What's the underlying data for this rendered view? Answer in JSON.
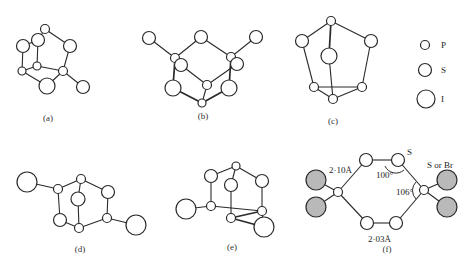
{
  "figure": {
    "legend": {
      "items": [
        {
          "symbol": "P",
          "label": "P",
          "r": 4.5,
          "cx": 425,
          "cy": 45
        },
        {
          "symbol": "S",
          "label": "S",
          "r": 6.5,
          "cx": 425,
          "cy": 70
        },
        {
          "symbol": "I",
          "label": "I",
          "r": 9,
          "cx": 426,
          "cy": 99
        }
      ],
      "label_x": 441
    },
    "panels": [
      {
        "id": "a",
        "caption": "(a)",
        "caption_pos": [
          48,
          121
        ],
        "atoms": [
          {
            "id": "p1",
            "type": "P",
            "cx": 45,
            "cy": 29,
            "r": 4.5
          },
          {
            "id": "s1",
            "type": "S",
            "cx": 38,
            "cy": 40,
            "r": 6.5
          },
          {
            "id": "i1",
            "type": "I",
            "cx": 23,
            "cy": 46,
            "r": 6.5
          },
          {
            "id": "s2",
            "type": "S",
            "cx": 70,
            "cy": 46,
            "r": 6.5
          },
          {
            "id": "p2",
            "type": "P",
            "cx": 37,
            "cy": 66,
            "r": 4
          },
          {
            "id": "p3",
            "type": "P",
            "cx": 22,
            "cy": 71,
            "r": 4
          },
          {
            "id": "p4",
            "type": "P",
            "cx": 63,
            "cy": 71,
            "r": 4.5
          },
          {
            "id": "i2",
            "type": "I",
            "cx": 47,
            "cy": 86,
            "r": 8
          },
          {
            "id": "s3",
            "type": "S",
            "cx": 83,
            "cy": 87,
            "r": 6.5
          }
        ],
        "bonds": [
          [
            "p1",
            "s1"
          ],
          [
            "p1",
            "s2"
          ],
          [
            "s2",
            "p4"
          ],
          [
            "s1",
            "p2"
          ],
          [
            "p2",
            "p4"
          ],
          [
            "i1",
            "p3"
          ],
          [
            "i1",
            "s1"
          ],
          [
            "p3",
            "i2"
          ],
          [
            "i2",
            "p4"
          ],
          [
            "p4",
            "s3"
          ],
          [
            "p3",
            "p2"
          ]
        ]
      },
      {
        "id": "b",
        "caption": "(b)",
        "caption_pos": [
          203,
          119
        ],
        "atoms": [
          {
            "id": "i1",
            "type": "S",
            "cx": 149,
            "cy": 38,
            "r": 6.5
          },
          {
            "id": "s1",
            "type": "S",
            "cx": 201,
            "cy": 37,
            "r": 6.5
          },
          {
            "id": "i2",
            "type": "S",
            "cx": 256,
            "cy": 37,
            "r": 6.5
          },
          {
            "id": "p1",
            "type": "P",
            "cx": 175,
            "cy": 58,
            "r": 4.5
          },
          {
            "id": "s2",
            "type": "S",
            "cx": 181,
            "cy": 65,
            "r": 6.5
          },
          {
            "id": "p2",
            "type": "P",
            "cx": 231,
            "cy": 57,
            "r": 4.5
          },
          {
            "id": "s3",
            "type": "S",
            "cx": 237,
            "cy": 64,
            "r": 6.5
          },
          {
            "id": "p3",
            "type": "P",
            "cx": 207,
            "cy": 85,
            "r": 4.5
          },
          {
            "id": "i3",
            "type": "I",
            "cx": 173,
            "cy": 88,
            "r": 8
          },
          {
            "id": "i4",
            "type": "I",
            "cx": 229,
            "cy": 88,
            "r": 8
          },
          {
            "id": "p4",
            "type": "P",
            "cx": 202,
            "cy": 103,
            "r": 4
          }
        ],
        "bonds": [
          [
            "i1",
            "p1"
          ],
          [
            "p1",
            "s1"
          ],
          [
            "s1",
            "p2"
          ],
          [
            "p2",
            "i2"
          ],
          [
            "p1",
            "i3"
          ],
          [
            "p2",
            "i4"
          ],
          [
            "s2",
            "p3"
          ],
          [
            "p3",
            "s3"
          ],
          [
            "i3",
            "p4"
          ],
          [
            "p4",
            "i4"
          ],
          [
            "p3",
            "p4"
          ]
        ],
        "thick_bonds": [
          [
            "p1",
            "i3"
          ],
          [
            "p2",
            "i4"
          ],
          [
            "i3",
            "p4"
          ],
          [
            "p4",
            "i4"
          ]
        ]
      },
      {
        "id": "c",
        "caption": "(c)",
        "caption_pos": [
          333,
          124
        ],
        "atoms": [
          {
            "id": "p1",
            "type": "P",
            "cx": 331,
            "cy": 21,
            "r": 4.5
          },
          {
            "id": "s1",
            "type": "S",
            "cx": 302,
            "cy": 41,
            "r": 6.5
          },
          {
            "id": "s2",
            "type": "S",
            "cx": 371,
            "cy": 41,
            "r": 6.5
          },
          {
            "id": "i1",
            "type": "I",
            "cx": 329,
            "cy": 56,
            "r": 8
          },
          {
            "id": "p2",
            "type": "P",
            "cx": 314,
            "cy": 87,
            "r": 4.5
          },
          {
            "id": "p3",
            "type": "P",
            "cx": 362,
            "cy": 87,
            "r": 4.5
          },
          {
            "id": "p4",
            "type": "P",
            "cx": 333,
            "cy": 99,
            "r": 4.5
          }
        ],
        "bonds": [
          [
            "p1",
            "s1"
          ],
          [
            "p1",
            "s2"
          ],
          [
            "s1",
            "p2"
          ],
          [
            "s2",
            "p3"
          ],
          [
            "p2",
            "p3"
          ],
          [
            "p2",
            "p4"
          ],
          [
            "p3",
            "p4"
          ],
          [
            "p1",
            "i1"
          ],
          [
            "i1",
            "p4"
          ]
        ],
        "thick_bonds": [
          [
            "p1",
            "i1"
          ]
        ]
      },
      {
        "id": "d",
        "caption": "(d)",
        "caption_pos": [
          80,
          252
        ],
        "atoms": [
          {
            "id": "i1",
            "type": "I",
            "cx": 27,
            "cy": 182,
            "r": 10
          },
          {
            "id": "p1",
            "type": "P",
            "cx": 58,
            "cy": 189,
            "r": 4.5
          },
          {
            "id": "p2",
            "type": "P",
            "cx": 81,
            "cy": 179,
            "r": 4.5
          },
          {
            "id": "s1",
            "type": "S",
            "cx": 78,
            "cy": 199,
            "r": 7
          },
          {
            "id": "s2",
            "type": "S",
            "cx": 108,
            "cy": 192,
            "r": 6.5
          },
          {
            "id": "s3",
            "type": "S",
            "cx": 60,
            "cy": 220,
            "r": 6.5
          },
          {
            "id": "p3",
            "type": "P",
            "cx": 107,
            "cy": 218,
            "r": 4.5
          },
          {
            "id": "p4",
            "type": "P",
            "cx": 79,
            "cy": 228,
            "r": 4.5
          },
          {
            "id": "i2",
            "type": "I",
            "cx": 136,
            "cy": 225,
            "r": 10
          }
        ],
        "bonds": [
          [
            "i1",
            "p1"
          ],
          [
            "p1",
            "p2"
          ],
          [
            "p2",
            "s2"
          ],
          [
            "s2",
            "p3"
          ],
          [
            "p1",
            "s3"
          ],
          [
            "s3",
            "p4"
          ],
          [
            "p4",
            "p3"
          ],
          [
            "p2",
            "s1"
          ],
          [
            "s1",
            "p4"
          ],
          [
            "p3",
            "i2"
          ]
        ]
      },
      {
        "id": "e",
        "caption": "(e)",
        "caption_pos": [
          232,
          250
        ],
        "atoms": [
          {
            "id": "p1",
            "type": "P",
            "cx": 236,
            "cy": 166,
            "r": 4
          },
          {
            "id": "s1",
            "type": "S",
            "cx": 211,
            "cy": 176,
            "r": 6.5
          },
          {
            "id": "s2",
            "type": "S",
            "cx": 262,
            "cy": 181,
            "r": 6.5
          },
          {
            "id": "s3",
            "type": "S",
            "cx": 231,
            "cy": 185,
            "r": 6.5
          },
          {
            "id": "i1",
            "type": "I",
            "cx": 186,
            "cy": 209,
            "r": 10
          },
          {
            "id": "p2",
            "type": "P",
            "cx": 211,
            "cy": 206,
            "r": 4.5
          },
          {
            "id": "p3",
            "type": "P",
            "cx": 262,
            "cy": 211,
            "r": 4.5
          },
          {
            "id": "p4",
            "type": "P",
            "cx": 231,
            "cy": 218,
            "r": 4.5
          },
          {
            "id": "i2",
            "type": "I",
            "cx": 264,
            "cy": 227,
            "r": 10
          }
        ],
        "bonds": [
          [
            "p1",
            "s1"
          ],
          [
            "p1",
            "s2"
          ],
          [
            "p1",
            "s3"
          ],
          [
            "s1",
            "p2"
          ],
          [
            "s2",
            "p3"
          ],
          [
            "p2",
            "i1"
          ],
          [
            "p2",
            "p3"
          ],
          [
            "s3",
            "p4"
          ],
          [
            "p4",
            "p3"
          ],
          [
            "p4",
            "i2"
          ],
          [
            "p3",
            "i2"
          ]
        ],
        "thick_bonds": [
          [
            "p4",
            "p3"
          ],
          [
            "p4",
            "i2"
          ]
        ]
      },
      {
        "id": "f",
        "caption": "(f)",
        "caption_pos": [
          387,
          252
        ],
        "atoms": [
          {
            "id": "p1",
            "type": "P",
            "cx": 338,
            "cy": 192,
            "r": 4.5
          },
          {
            "id": "s1",
            "type": "S",
            "cx": 366,
            "cy": 160,
            "r": 6.5
          },
          {
            "id": "s2",
            "type": "S",
            "cx": 398,
            "cy": 160,
            "r": 6.5
          },
          {
            "id": "p2",
            "type": "P",
            "cx": 424,
            "cy": 190,
            "r": 4.5
          },
          {
            "id": "s3",
            "type": "S",
            "cx": 367,
            "cy": 223,
            "r": 6.5
          },
          {
            "id": "s4",
            "type": "S",
            "cx": 396,
            "cy": 223,
            "r": 6.5
          },
          {
            "id": "x1",
            "type": "X",
            "cx": 316,
            "cy": 180,
            "r": 10,
            "shaded": true
          },
          {
            "id": "x2",
            "type": "X",
            "cx": 316,
            "cy": 207,
            "r": 10,
            "shaded": true
          },
          {
            "id": "x3",
            "type": "X",
            "cx": 447,
            "cy": 180,
            "r": 10,
            "shaded": true
          },
          {
            "id": "x4",
            "type": "X",
            "cx": 447,
            "cy": 207,
            "r": 10,
            "shaded": true
          }
        ],
        "bonds": [
          [
            "p1",
            "s1"
          ],
          [
            "s1",
            "s2"
          ],
          [
            "s2",
            "p2"
          ],
          [
            "p1",
            "s3"
          ],
          [
            "s3",
            "s4"
          ],
          [
            "s4",
            "p2"
          ],
          [
            "p1",
            "x1"
          ],
          [
            "p1",
            "x2"
          ],
          [
            "p2",
            "x3"
          ],
          [
            "p2",
            "x4"
          ]
        ],
        "annotations": [
          {
            "name": "bond-length-p-s",
            "text": "2·10Å",
            "x": 329,
            "y": 173
          },
          {
            "name": "bond-length-s-s",
            "text": "2·03Å",
            "x": 368,
            "y": 242
          },
          {
            "name": "angle-s",
            "text": "100°",
            "x": 376,
            "y": 178
          },
          {
            "name": "angle-p",
            "text": "106°",
            "x": 396,
            "y": 195
          },
          {
            "name": "atom-label-s",
            "text": "S",
            "x": 407,
            "y": 155
          },
          {
            "name": "atom-label-s-or-br",
            "text": "S or Br",
            "x": 427,
            "y": 168
          }
        ],
        "arcs": [
          {
            "name": "angle-arc-s",
            "d": "M 385 166 A 12 12 0 0 0 404 170"
          },
          {
            "name": "angle-arc-p",
            "d": "M 416 182 A 12 12 0 0 0 416 199"
          }
        ]
      }
    ]
  }
}
